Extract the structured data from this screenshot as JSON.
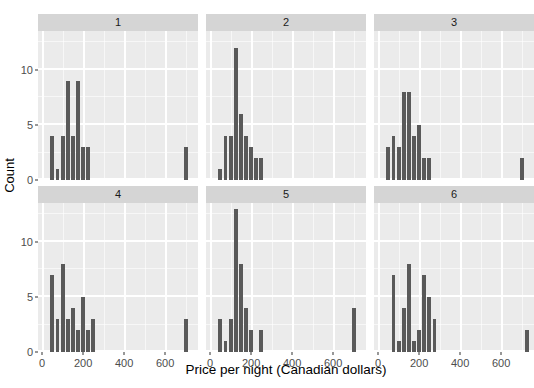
{
  "chart_data": {
    "type": "bar",
    "subtype": "faceted-histogram",
    "title": "",
    "xlabel": "Price per night (Canadian dollars)",
    "ylabel": "Count",
    "xlim": [
      -20,
      760
    ],
    "ylim": [
      0,
      13.5
    ],
    "xticks": [
      0,
      200,
      400,
      600
    ],
    "xticklabels": [
      "0",
      "200",
      "400",
      "600"
    ],
    "yticks": [
      0,
      5,
      10
    ],
    "yticklabels": [
      "0",
      "5",
      "10"
    ],
    "grid": true,
    "grid_major_color": "#ffffff",
    "grid_minor_color": "#ffffff",
    "panel_background": "#ebebeb",
    "strip_background": "#d5d5d5",
    "bar_color": "#595959",
    "bin_width": 25,
    "legend": "none",
    "facet_rows": 2,
    "facet_cols": 3,
    "facets": [
      {
        "label": "1",
        "bins": [
          {
            "x": 50,
            "count": 4
          },
          {
            "x": 75,
            "count": 1
          },
          {
            "x": 100,
            "count": 4
          },
          {
            "x": 125,
            "count": 9
          },
          {
            "x": 150,
            "count": 4
          },
          {
            "x": 175,
            "count": 9
          },
          {
            "x": 200,
            "count": 3
          },
          {
            "x": 225,
            "count": 3
          },
          {
            "x": 700,
            "count": 3
          }
        ]
      },
      {
        "label": "2",
        "bins": [
          {
            "x": 50,
            "count": 1
          },
          {
            "x": 75,
            "count": 4
          },
          {
            "x": 100,
            "count": 4
          },
          {
            "x": 125,
            "count": 12
          },
          {
            "x": 150,
            "count": 6
          },
          {
            "x": 175,
            "count": 4
          },
          {
            "x": 200,
            "count": 3
          },
          {
            "x": 225,
            "count": 2
          },
          {
            "x": 250,
            "count": 2
          }
        ]
      },
      {
        "label": "3",
        "bins": [
          {
            "x": 50,
            "count": 3
          },
          {
            "x": 75,
            "count": 4
          },
          {
            "x": 100,
            "count": 3
          },
          {
            "x": 125,
            "count": 8
          },
          {
            "x": 150,
            "count": 8
          },
          {
            "x": 175,
            "count": 4
          },
          {
            "x": 200,
            "count": 5
          },
          {
            "x": 225,
            "count": 2
          },
          {
            "x": 250,
            "count": 2
          },
          {
            "x": 700,
            "count": 2
          }
        ]
      },
      {
        "label": "4",
        "bins": [
          {
            "x": 50,
            "count": 7
          },
          {
            "x": 75,
            "count": 3
          },
          {
            "x": 100,
            "count": 8
          },
          {
            "x": 125,
            "count": 3
          },
          {
            "x": 150,
            "count": 4
          },
          {
            "x": 175,
            "count": 2
          },
          {
            "x": 200,
            "count": 5
          },
          {
            "x": 225,
            "count": 2
          },
          {
            "x": 250,
            "count": 3
          },
          {
            "x": 700,
            "count": 3
          }
        ]
      },
      {
        "label": "5",
        "bins": [
          {
            "x": 50,
            "count": 3
          },
          {
            "x": 75,
            "count": 1
          },
          {
            "x": 100,
            "count": 3
          },
          {
            "x": 125,
            "count": 13
          },
          {
            "x": 150,
            "count": 8
          },
          {
            "x": 175,
            "count": 4
          },
          {
            "x": 200,
            "count": 2
          },
          {
            "x": 250,
            "count": 2
          },
          {
            "x": 700,
            "count": 4
          }
        ]
      },
      {
        "label": "6",
        "bins": [
          {
            "x": 75,
            "count": 7
          },
          {
            "x": 100,
            "count": 1
          },
          {
            "x": 125,
            "count": 4
          },
          {
            "x": 150,
            "count": 8
          },
          {
            "x": 175,
            "count": 1
          },
          {
            "x": 200,
            "count": 2
          },
          {
            "x": 225,
            "count": 7
          },
          {
            "x": 250,
            "count": 5
          },
          {
            "x": 275,
            "count": 3
          },
          {
            "x": 725,
            "count": 2
          }
        ]
      }
    ]
  }
}
